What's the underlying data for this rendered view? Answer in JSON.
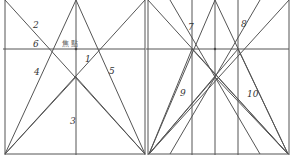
{
  "diagram": {
    "title": "",
    "colors": {
      "line": "#555555",
      "text": "#333333",
      "background": "#ffffff"
    },
    "left_panel": {
      "frame": {
        "left": 5,
        "right": 145,
        "top": 0,
        "bottom": 155
      },
      "horizon_y": 49,
      "center_x": 76,
      "focal_label": "焦 點",
      "labels": [
        {
          "id": "2",
          "text": "2",
          "x": 33,
          "y": 28
        },
        {
          "id": "6",
          "text": "6",
          "x": 33,
          "y": 47
        },
        {
          "id": "1",
          "text": "1",
          "x": 85,
          "y": 62
        },
        {
          "id": "4",
          "text": "4",
          "x": 34,
          "y": 75
        },
        {
          "id": "5",
          "text": "5",
          "x": 109,
          "y": 74
        },
        {
          "id": "3",
          "text": "3",
          "x": 70,
          "y": 124
        }
      ]
    },
    "right_panel": {
      "frame": {
        "left": 148,
        "right": 289,
        "top": 0,
        "bottom": 155
      },
      "horizon_y": 49,
      "verticals_x": [
        192,
        215,
        238
      ],
      "labels": [
        {
          "id": "7",
          "text": "7",
          "x": 188,
          "y": 30
        },
        {
          "id": "8",
          "text": "8",
          "x": 241,
          "y": 27
        },
        {
          "id": "9",
          "text": "9",
          "x": 180,
          "y": 96
        },
        {
          "id": "10",
          "text": "10",
          "x": 247,
          "y": 97
        }
      ]
    }
  }
}
